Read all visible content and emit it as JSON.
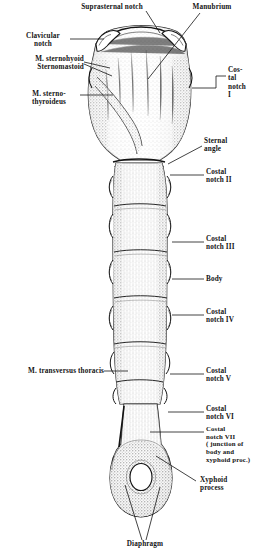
{
  "figure": {
    "kind": "anatomical-illustration",
    "background_color": "#ffffff",
    "ink_color": "#141414",
    "width": 272,
    "height": 558
  },
  "labels": {
    "suprasternal_notch": "Suprasternal notch",
    "manubrium": "Manubrium",
    "clavicular_notch": "Clavicular\nnotch",
    "m_sternohyoid": "M. sternohyoid\nSternomastoid",
    "m_sternothyroideus": "M. sterno-\nthyroideus",
    "costal_notch_i": "Cos-\ntal\nnotch\nI",
    "sternal_angle": "Sternal\nangle",
    "costal_notch_ii": "Costal\nnotch II",
    "costal_notch_iii": "Costal\nnotch III",
    "body": "Body",
    "costal_notch_iv": "Costal\nnotch IV",
    "m_transversus_thoracis": "M. transversus thoracis",
    "costal_notch_v": "Costal\nnotch V",
    "costal_notch_vi": "Costal\nnotch VI",
    "costal_notch_vii": "Costal\nnotch VII\n( junction of\nbody and\nxyphoid proc.)",
    "xyphoid_process": "Xyphoid\nprocess",
    "diaphragm": "Diaphragm"
  }
}
